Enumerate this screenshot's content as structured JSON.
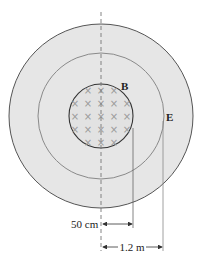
{
  "diagram": {
    "center": [
      101,
      116
    ],
    "outer_circle": {
      "radius": 92,
      "fill": "#e6e6e6",
      "stroke": "#555555"
    },
    "middle_circle": {
      "radius": 63,
      "stroke": "#8a8a8a",
      "label": "E"
    },
    "inner_circle": {
      "radius": 32,
      "stroke": "#333333",
      "label": "B",
      "field_symbol": "×",
      "field_direction": "into-page"
    },
    "field_marks_rows": [
      [
        88,
        101,
        114
      ],
      [
        75,
        88,
        101,
        114,
        127
      ],
      [
        75,
        88,
        101,
        114,
        127
      ],
      [
        75,
        88,
        101,
        114,
        127
      ],
      [
        88,
        101,
        114
      ]
    ],
    "field_marks_row_y": [
      90,
      103,
      116,
      129,
      142
    ],
    "dimensions": [
      {
        "label": "50 cm",
        "from_x": 101,
        "to_x": 133,
        "y": 224
      },
      {
        "label": "1.2 m",
        "from_x": 101,
        "to_x": 163,
        "y": 247
      }
    ],
    "axis_line": {
      "style": "dashed",
      "x": 101,
      "y_start": 12,
      "y_end": 251
    }
  },
  "labels": {
    "b_label": "B",
    "e_label": "E",
    "dim_small": "50 cm",
    "dim_large": "1.2 m"
  }
}
